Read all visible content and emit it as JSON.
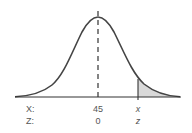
{
  "diagram": {
    "type": "normal-distribution",
    "mean_label": "45",
    "z_mean_label": "0",
    "x_value_label": "x",
    "z_value_label": "z",
    "row_labels": {
      "x": "X:",
      "z": "Z:"
    },
    "shaded_region": "right-tail beyond x",
    "colors": {
      "curve": "#444444",
      "axis": "#333333",
      "shade": "#d9d9d9",
      "text": "#555555"
    }
  }
}
